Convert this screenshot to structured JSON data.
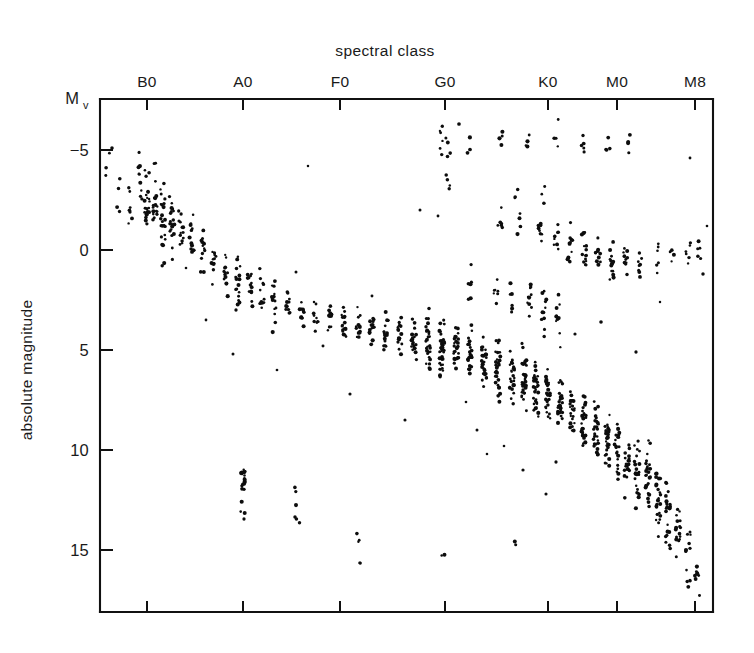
{
  "figure": {
    "title": "spectral class",
    "y_axis_label": "absolute magnitude",
    "y_axis_symbol": "M",
    "y_axis_symbol_sub": "v",
    "ink_color": "#0d0d0d",
    "background_color": "#ffffff"
  },
  "chart_data": {
    "type": "scatter",
    "title": "spectral class",
    "subtitle": "",
    "xlabel": "spectral class",
    "ylabel": "absolute magnitude",
    "x_categories": [
      "B0",
      "A0",
      "F0",
      "G0",
      "K0",
      "M0",
      "M8"
    ],
    "x_tick_pixels": [
      147,
      243,
      340,
      445,
      548,
      617,
      695
    ],
    "y_ticks": [
      -5,
      0,
      5,
      10,
      15
    ],
    "ylim": [
      -7.2,
      17.2
    ],
    "y_inverted": true,
    "grid": false,
    "legend": null,
    "marker": "dot",
    "series": [
      {
        "name": "main sequence",
        "comment": "dense band from upper-left to lower-right",
        "columns": [
          {
            "x": 108,
            "n": 3,
            "mag_center": -4.4,
            "mag_spread": 1.4
          },
          {
            "x": 118,
            "n": 4,
            "mag_center": -2.7,
            "mag_spread": 1.1
          },
          {
            "x": 130,
            "n": 6,
            "mag_center": -2.6,
            "mag_spread": 1.4
          },
          {
            "x": 140,
            "n": 9,
            "mag_center": -3.2,
            "mag_spread": 1.6
          },
          {
            "x": 147,
            "n": 22,
            "mag_center": -2.4,
            "mag_spread": 1.9
          },
          {
            "x": 155,
            "n": 18,
            "mag_center": -2.2,
            "mag_spread": 1.7
          },
          {
            "x": 163,
            "n": 24,
            "mag_center": -1.9,
            "mag_spread": 1.8
          },
          {
            "x": 172,
            "n": 20,
            "mag_center": -1.4,
            "mag_spread": 1.6
          },
          {
            "x": 181,
            "n": 14,
            "mag_center": -1.0,
            "mag_spread": 1.4
          },
          {
            "x": 192,
            "n": 12,
            "mag_center": -0.4,
            "mag_spread": 1.3
          },
          {
            "x": 203,
            "n": 13,
            "mag_center": 0.1,
            "mag_spread": 1.3
          },
          {
            "x": 214,
            "n": 11,
            "mag_center": 0.6,
            "mag_spread": 1.2
          },
          {
            "x": 226,
            "n": 12,
            "mag_center": 1.1,
            "mag_spread": 1.3
          },
          {
            "x": 238,
            "n": 16,
            "mag_center": 1.6,
            "mag_spread": 1.4
          },
          {
            "x": 250,
            "n": 13,
            "mag_center": 1.9,
            "mag_spread": 1.2
          },
          {
            "x": 262,
            "n": 12,
            "mag_center": 2.2,
            "mag_spread": 1.1
          },
          {
            "x": 274,
            "n": 14,
            "mag_center": 2.5,
            "mag_spread": 1.1
          },
          {
            "x": 288,
            "n": 12,
            "mag_center": 2.8,
            "mag_spread": 1.0
          },
          {
            "x": 302,
            "n": 11,
            "mag_center": 3.1,
            "mag_spread": 1.0
          },
          {
            "x": 316,
            "n": 10,
            "mag_center": 3.3,
            "mag_spread": 0.9
          },
          {
            "x": 330,
            "n": 12,
            "mag_center": 3.5,
            "mag_spread": 1.0
          },
          {
            "x": 344,
            "n": 16,
            "mag_center": 3.7,
            "mag_spread": 1.0
          },
          {
            "x": 358,
            "n": 13,
            "mag_center": 3.9,
            "mag_spread": 1.0
          },
          {
            "x": 372,
            "n": 14,
            "mag_center": 4.0,
            "mag_spread": 1.1
          },
          {
            "x": 386,
            "n": 18,
            "mag_center": 4.2,
            "mag_spread": 1.2
          },
          {
            "x": 400,
            "n": 16,
            "mag_center": 4.3,
            "mag_spread": 1.1
          },
          {
            "x": 414,
            "n": 22,
            "mag_center": 4.4,
            "mag_spread": 1.2
          },
          {
            "x": 428,
            "n": 30,
            "mag_center": 4.6,
            "mag_spread": 1.3
          },
          {
            "x": 442,
            "n": 38,
            "mag_center": 4.8,
            "mag_spread": 1.4
          },
          {
            "x": 456,
            "n": 26,
            "mag_center": 5.0,
            "mag_spread": 1.3
          },
          {
            "x": 470,
            "n": 24,
            "mag_center": 5.2,
            "mag_spread": 1.3
          },
          {
            "x": 484,
            "n": 28,
            "mag_center": 5.5,
            "mag_spread": 1.4
          },
          {
            "x": 498,
            "n": 30,
            "mag_center": 5.9,
            "mag_spread": 1.5
          },
          {
            "x": 512,
            "n": 26,
            "mag_center": 6.2,
            "mag_spread": 1.4
          },
          {
            "x": 524,
            "n": 34,
            "mag_center": 6.6,
            "mag_spread": 1.5
          },
          {
            "x": 536,
            "n": 30,
            "mag_center": 7.0,
            "mag_spread": 1.4
          },
          {
            "x": 548,
            "n": 28,
            "mag_center": 7.4,
            "mag_spread": 1.4
          },
          {
            "x": 560,
            "n": 26,
            "mag_center": 7.8,
            "mag_spread": 1.3
          },
          {
            "x": 572,
            "n": 24,
            "mag_center": 8.2,
            "mag_spread": 1.3
          },
          {
            "x": 584,
            "n": 26,
            "mag_center": 8.7,
            "mag_spread": 1.4
          },
          {
            "x": 596,
            "n": 28,
            "mag_center": 9.2,
            "mag_spread": 1.4
          },
          {
            "x": 607,
            "n": 26,
            "mag_center": 9.6,
            "mag_spread": 1.4
          },
          {
            "x": 617,
            "n": 24,
            "mag_center": 10.1,
            "mag_spread": 1.4
          },
          {
            "x": 627,
            "n": 22,
            "mag_center": 10.6,
            "mag_spread": 1.4
          },
          {
            "x": 637,
            "n": 24,
            "mag_center": 11.1,
            "mag_spread": 1.5
          },
          {
            "x": 648,
            "n": 26,
            "mag_center": 11.7,
            "mag_spread": 1.6
          },
          {
            "x": 658,
            "n": 24,
            "mag_center": 12.4,
            "mag_spread": 1.7
          },
          {
            "x": 668,
            "n": 22,
            "mag_center": 13.2,
            "mag_spread": 1.8
          },
          {
            "x": 678,
            "n": 16,
            "mag_center": 14.2,
            "mag_spread": 1.7
          },
          {
            "x": 688,
            "n": 12,
            "mag_center": 15.3,
            "mag_spread": 1.6
          },
          {
            "x": 697,
            "n": 8,
            "mag_center": 16.2,
            "mag_spread": 1.1
          }
        ]
      },
      {
        "name": "giant branch",
        "comment": "luminous evolved stars near magnitude 0 to 1 at G, K and M",
        "columns": [
          {
            "x": 440,
            "n": 6,
            "mag_center": -5.4,
            "mag_spread": 1.2
          },
          {
            "x": 448,
            "n": 4,
            "mag_center": -5.1,
            "mag_spread": 0.8
          },
          {
            "x": 470,
            "n": 3,
            "mag_center": -5.5,
            "mag_spread": 0.7
          },
          {
            "x": 500,
            "n": 4,
            "mag_center": -5.6,
            "mag_spread": 0.6
          },
          {
            "x": 528,
            "n": 4,
            "mag_center": -5.5,
            "mag_spread": 0.8
          },
          {
            "x": 556,
            "n": 4,
            "mag_center": -5.6,
            "mag_spread": 0.7
          },
          {
            "x": 582,
            "n": 5,
            "mag_center": -5.5,
            "mag_spread": 0.8
          },
          {
            "x": 608,
            "n": 4,
            "mag_center": -5.4,
            "mag_spread": 0.6
          },
          {
            "x": 628,
            "n": 4,
            "mag_center": -5.5,
            "mag_spread": 0.7
          },
          {
            "x": 448,
            "n": 4,
            "mag_center": -3.2,
            "mag_spread": 0.6
          },
          {
            "x": 516,
            "n": 3,
            "mag_center": -3.0,
            "mag_spread": 0.5
          },
          {
            "x": 544,
            "n": 3,
            "mag_center": -2.8,
            "mag_spread": 0.6
          },
          {
            "x": 500,
            "n": 6,
            "mag_center": -1.6,
            "mag_spread": 1.0
          },
          {
            "x": 520,
            "n": 5,
            "mag_center": -1.5,
            "mag_spread": 0.9
          },
          {
            "x": 540,
            "n": 8,
            "mag_center": -0.9,
            "mag_spread": 1.1
          },
          {
            "x": 556,
            "n": 10,
            "mag_center": -0.6,
            "mag_spread": 1.2
          },
          {
            "x": 570,
            "n": 12,
            "mag_center": -0.2,
            "mag_spread": 1.2
          },
          {
            "x": 584,
            "n": 14,
            "mag_center": 0.1,
            "mag_spread": 1.1
          },
          {
            "x": 598,
            "n": 12,
            "mag_center": 0.3,
            "mag_spread": 1.0
          },
          {
            "x": 612,
            "n": 14,
            "mag_center": 0.4,
            "mag_spread": 1.0
          },
          {
            "x": 626,
            "n": 10,
            "mag_center": 0.5,
            "mag_spread": 0.9
          },
          {
            "x": 640,
            "n": 8,
            "mag_center": 0.4,
            "mag_spread": 0.9
          },
          {
            "x": 656,
            "n": 6,
            "mag_center": 0.3,
            "mag_spread": 0.8
          },
          {
            "x": 672,
            "n": 5,
            "mag_center": 0.2,
            "mag_spread": 0.8
          },
          {
            "x": 688,
            "n": 6,
            "mag_center": 0.0,
            "mag_spread": 0.9
          },
          {
            "x": 700,
            "n": 5,
            "mag_center": -0.3,
            "mag_spread": 0.8
          },
          {
            "x": 470,
            "n": 6,
            "mag_center": 1.6,
            "mag_spread": 1.0
          },
          {
            "x": 496,
            "n": 7,
            "mag_center": 2.0,
            "mag_spread": 1.1
          },
          {
            "x": 512,
            "n": 6,
            "mag_center": 2.4,
            "mag_spread": 1.0
          },
          {
            "x": 530,
            "n": 10,
            "mag_center": 2.7,
            "mag_spread": 1.2
          },
          {
            "x": 544,
            "n": 12,
            "mag_center": 3.0,
            "mag_spread": 1.3
          },
          {
            "x": 558,
            "n": 10,
            "mag_center": 3.3,
            "mag_spread": 1.2
          }
        ]
      },
      {
        "name": "white dwarfs",
        "comment": "small dense clump near spectral class A0 at magnitude 11.5",
        "columns": [
          {
            "x": 243,
            "n": 18,
            "mag_center": 11.5,
            "mag_spread": 0.9
          },
          {
            "x": 243,
            "n": 3,
            "mag_center": 13.3,
            "mag_spread": 0.3
          },
          {
            "x": 295,
            "n": 3,
            "mag_center": 12.1,
            "mag_spread": 0.6
          },
          {
            "x": 297,
            "n": 3,
            "mag_center": 13.4,
            "mag_spread": 0.4
          },
          {
            "x": 357,
            "n": 3,
            "mag_center": 14.6,
            "mag_spread": 0.5
          },
          {
            "x": 358,
            "n": 2,
            "mag_center": 15.7,
            "mag_spread": 0.2
          },
          {
            "x": 444,
            "n": 2,
            "mag_center": 15.3,
            "mag_spread": 0.3
          },
          {
            "x": 514,
            "n": 2,
            "mag_center": 14.7,
            "mag_spread": 0.3
          }
        ]
      },
      {
        "name": "scattered outliers",
        "comment": "isolated field points away from the main bands",
        "points": [
          {
            "x": 112,
            "mag": -5.1
          },
          {
            "x": 130,
            "mag": -1.9
          },
          {
            "x": 186,
            "mag": 0.9
          },
          {
            "x": 206,
            "mag": 3.5
          },
          {
            "x": 233,
            "mag": 5.2
          },
          {
            "x": 236,
            "mag": 3.0
          },
          {
            "x": 277,
            "mag": 6.0
          },
          {
            "x": 296,
            "mag": 1.1
          },
          {
            "x": 308,
            "mag": -4.2
          },
          {
            "x": 323,
            "mag": 4.8
          },
          {
            "x": 350,
            "mag": 7.2
          },
          {
            "x": 372,
            "mag": 2.3
          },
          {
            "x": 405,
            "mag": 8.5
          },
          {
            "x": 420,
            "mag": -2.0
          },
          {
            "x": 438,
            "mag": -1.7
          },
          {
            "x": 459,
            "mag": -6.3
          },
          {
            "x": 466,
            "mag": 7.6
          },
          {
            "x": 477,
            "mag": 9.0
          },
          {
            "x": 487,
            "mag": 10.2
          },
          {
            "x": 504,
            "mag": 9.8
          },
          {
            "x": 523,
            "mag": 11.0
          },
          {
            "x": 546,
            "mag": 12.2
          },
          {
            "x": 556,
            "mag": 10.6
          },
          {
            "x": 575,
            "mag": 4.2
          },
          {
            "x": 601,
            "mag": 3.6
          },
          {
            "x": 636,
            "mag": 5.1
          },
          {
            "x": 660,
            "mag": 2.6
          },
          {
            "x": 690,
            "mag": -4.6
          },
          {
            "x": 703,
            "mag": 1.2
          },
          {
            "x": 707,
            "mag": -1.2
          }
        ]
      }
    ]
  }
}
